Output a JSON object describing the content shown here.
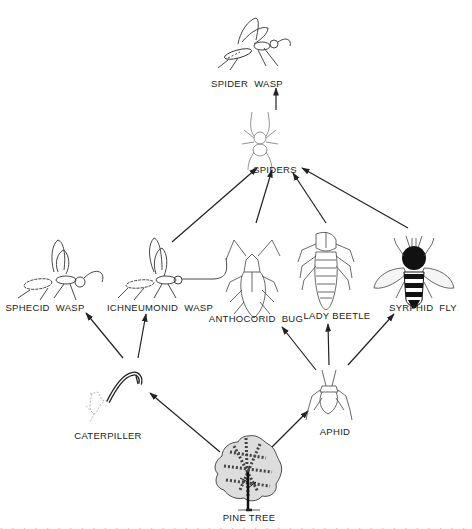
{
  "diagram": {
    "type": "food-web",
    "line_color": "#222222",
    "background": "#ffffff",
    "nodes": [
      {
        "id": "spider_wasp",
        "label": "SPIDER WASP",
        "icon": "wasp-icon",
        "x": 246,
        "y": 83
      },
      {
        "id": "spiders",
        "label": "SPIDERS",
        "icon": "spider-icon",
        "x": 252,
        "y": 175
      },
      {
        "id": "sphecid_wasp",
        "label": "SPHECID WASP",
        "icon": "wasp-icon",
        "x": 44,
        "y": 307
      },
      {
        "id": "ichneumonid_wasp",
        "label": "ICHNEUMONID WASP",
        "icon": "wasp-icon",
        "x": 159,
        "y": 307
      },
      {
        "id": "anthocorid_bug",
        "label": "ANTHOCORID BUG",
        "icon": "bug-icon",
        "x": 256,
        "y": 318
      },
      {
        "id": "lady_beetle",
        "label": "LADY BEETLE",
        "icon": "beetle-larva-icon",
        "x": 336,
        "y": 316
      },
      {
        "id": "syrphid_fly",
        "label": "SYRPHID FLY",
        "icon": "fly-icon",
        "x": 422,
        "y": 307
      },
      {
        "id": "caterpiller",
        "label": "CATERPILLER",
        "icon": "caterpillar-icon",
        "x": 108,
        "y": 435
      },
      {
        "id": "aphid",
        "label": "APHID",
        "icon": "aphid-icon",
        "x": 334,
        "y": 431
      },
      {
        "id": "pine_tree",
        "label": "PINE TREE",
        "icon": "tree-icon",
        "x": 248,
        "y": 518
      }
    ],
    "edges": [
      {
        "from": "pine_tree",
        "to": "caterpiller"
      },
      {
        "from": "pine_tree",
        "to": "aphid"
      },
      {
        "from": "caterpiller",
        "to": "sphecid_wasp"
      },
      {
        "from": "caterpiller",
        "to": "ichneumonid_wasp"
      },
      {
        "from": "aphid",
        "to": "anthocorid_bug"
      },
      {
        "from": "aphid",
        "to": "lady_beetle"
      },
      {
        "from": "aphid",
        "to": "syrphid_fly"
      },
      {
        "from": "ichneumonid_wasp",
        "to": "spiders"
      },
      {
        "from": "anthocorid_bug",
        "to": "spiders"
      },
      {
        "from": "lady_beetle",
        "to": "spiders"
      },
      {
        "from": "syrphid_fly",
        "to": "spiders"
      },
      {
        "from": "spiders",
        "to": "spider_wasp"
      }
    ]
  },
  "labels": {
    "spider_wasp": [
      "SPIDER",
      "WASP"
    ],
    "spiders": "SPIDERS",
    "sphecid_wasp": [
      "SPHECID",
      "WASP"
    ],
    "ichneumonid_wasp": [
      "ICHNEUMONID",
      "WASP"
    ],
    "anthocorid_bug": [
      "ANTHOCORID",
      "BUG"
    ],
    "lady_beetle": "LADY BEETLE",
    "syrphid_fly": [
      "SYRPHID",
      "FLY"
    ],
    "caterpiller": "CATERPILLER",
    "aphid": "APHID",
    "pine_tree": "PINE TREE"
  }
}
